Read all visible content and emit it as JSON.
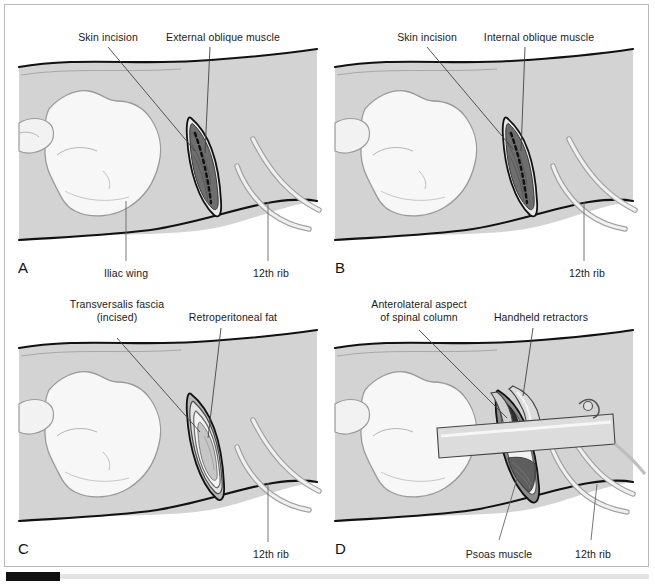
{
  "figure": {
    "panel_count": 4,
    "style": {
      "skin_fill": "#d3d3d3",
      "bone_fill": "#f7f7f7",
      "muscle_fill": "#6e6e6e",
      "fat_fill": "#c6c6c6",
      "rib_fill": "#ededed",
      "retractor_fill": "#dcdcdc",
      "outline": "#111111",
      "soft_outline": "#9a9a9a",
      "label_color": "#1a1a1a",
      "frame_border": "#b9b9b9",
      "background": "#ffffff"
    }
  },
  "panels": [
    {
      "id": "A",
      "letter": "A",
      "labels_top": [
        {
          "text": "Skin incision"
        },
        {
          "text": "External oblique muscle"
        }
      ],
      "labels_bottom": [
        {
          "text": "Iliac wing"
        },
        {
          "text": "12th rib"
        }
      ]
    },
    {
      "id": "B",
      "letter": "B",
      "labels_top": [
        {
          "text": "Skin incision"
        },
        {
          "text": "Internal oblique muscle"
        }
      ],
      "labels_bottom": [
        {
          "text": "12th rib"
        }
      ]
    },
    {
      "id": "C",
      "letter": "C",
      "labels_top": [
        {
          "text": "Transversalis fascia"
        },
        {
          "text": "(incised)"
        },
        {
          "text": "Retroperitoneal fat"
        }
      ],
      "labels_bottom": [
        {
          "text": "12th rib"
        }
      ]
    },
    {
      "id": "D",
      "letter": "D",
      "labels_top": [
        {
          "text": "Anterolateral aspect"
        },
        {
          "text": "of spinal column"
        },
        {
          "text": "Handheld retractors"
        }
      ],
      "labels_bottom": [
        {
          "text": "Psoas muscle"
        },
        {
          "text": "12th rib"
        }
      ]
    }
  ]
}
